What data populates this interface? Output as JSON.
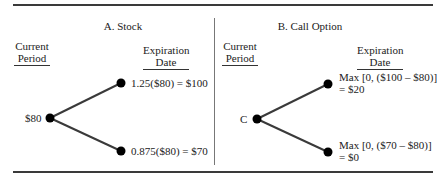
{
  "panels": [
    {
      "title": "A. Stock",
      "current_label": [
        "Current",
        "Period"
      ],
      "expiration_label": [
        "Expiration",
        "Date"
      ],
      "root_label": "$80",
      "up_label": [
        "1.25($80) = $100"
      ],
      "down_label": [
        "0.875($80) = $70"
      ]
    },
    {
      "title": "B. Call Option",
      "current_label": [
        "Current",
        "Period"
      ],
      "expiration_label": [
        "Expiration",
        "Date"
      ],
      "root_label": "C",
      "up_label": [
        "Max [0, ($100 – $80)]",
        "= $20"
      ],
      "down_label": [
        "Max [0, ($70 – $80)]",
        "= $0"
      ]
    }
  ],
  "colors": {
    "line": "#3a3a3a",
    "node": "#000000",
    "text": "#222222"
  }
}
